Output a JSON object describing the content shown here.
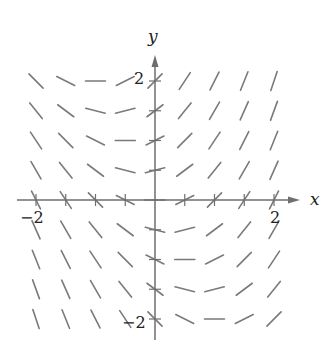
{
  "diagram": {
    "type": "slope_field",
    "equation_implied": "dy/dx = x + y/2",
    "x_axis": {
      "label": "x",
      "tick_labels": [
        {
          "value": -2,
          "text": "−2"
        },
        {
          "value": 2,
          "text": "2"
        }
      ]
    },
    "y_axis": {
      "label": "y",
      "tick_labels": [
        {
          "value": 2,
          "text": "2"
        },
        {
          "value": -2,
          "text": "−2"
        }
      ]
    },
    "grid": {
      "x_min": -2,
      "x_max": 2,
      "y_min": -2,
      "y_max": 2,
      "step": 0.5
    },
    "colors": {
      "segment": "#7a7a7a",
      "axis": "#6e6e6e",
      "text": "#222222"
    }
  },
  "layout": {
    "origin_px": [
      155,
      200
    ],
    "px_per_unit": 59.5,
    "segment_length_px": 20,
    "x_axis_px": [
      17,
      300
    ],
    "y_axis_px": [
      55,
      340
    ]
  }
}
